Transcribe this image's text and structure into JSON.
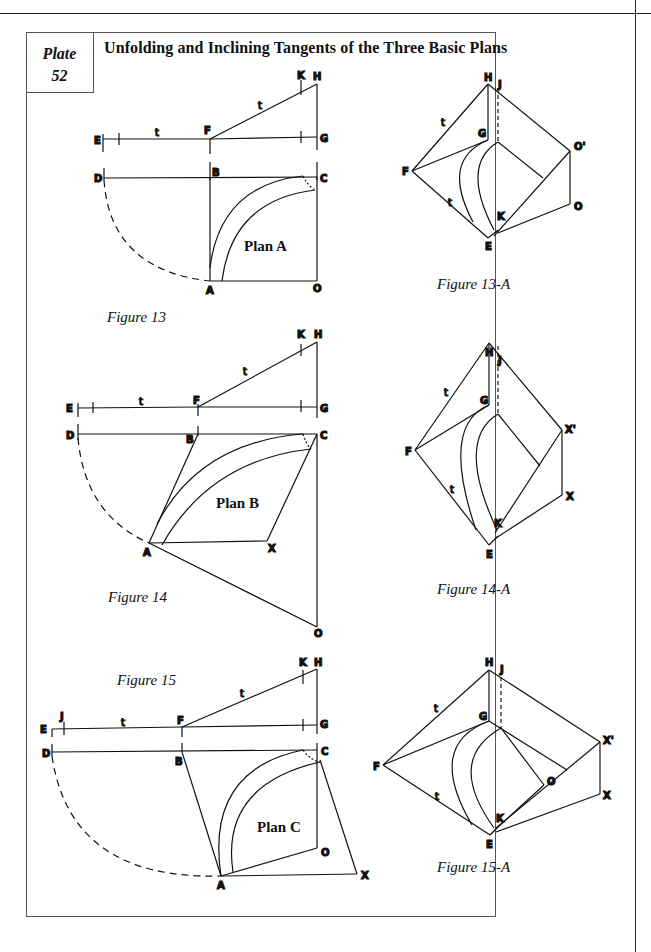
{
  "header": {
    "running_text": "...ng and ...ng"
  },
  "plate": {
    "word": "Plate",
    "number": "52"
  },
  "title": "Unfolding and Inclining Tangents of the Three Basic Plans",
  "figures": [
    {
      "id": "figure-13",
      "caption": "Figure 13",
      "plan_label": "Plan A",
      "points": {
        "E": "E",
        "F": "F",
        "G": "G",
        "H": "H",
        "K": "K",
        "D": "D",
        "B": "B",
        "C": "C",
        "A": "A",
        "O": "O",
        "t1": "t",
        "t2": "t"
      }
    },
    {
      "id": "figure-13a",
      "caption": "Figure 13-A",
      "points": {
        "H": "H",
        "J": "J",
        "G": "G",
        "F": "F",
        "E": "E",
        "K": "K",
        "O": "O",
        "Oprime": "O'",
        "t1": "t",
        "t2": "t"
      }
    },
    {
      "id": "figure-14",
      "caption": "Figure 14",
      "plan_label": "Plan B",
      "points": {
        "E": "E",
        "F": "F",
        "G": "G",
        "H": "H",
        "K": "K",
        "D": "D",
        "B": "B",
        "C": "C",
        "A": "A",
        "X": "X",
        "O": "O",
        "t1": "t",
        "t2": "t"
      }
    },
    {
      "id": "figure-14a",
      "caption": "Figure 14-A",
      "points": {
        "H": "H",
        "J": "J",
        "G": "G",
        "F": "F",
        "E": "E",
        "K": "K",
        "X": "X",
        "Xprime": "X'",
        "t1": "t",
        "t2": "t"
      }
    },
    {
      "id": "figure-15",
      "caption": "Figure 15",
      "plan_label": "Plan C",
      "points": {
        "E": "E",
        "J": "J",
        "F": "F",
        "G": "G",
        "H": "H",
        "K": "K",
        "D": "D",
        "B": "B",
        "C": "C",
        "A": "A",
        "O": "O",
        "X": "X",
        "t1": "t",
        "t2": "t"
      }
    },
    {
      "id": "figure-15a",
      "caption": "Figure 15-A",
      "points": {
        "H": "H",
        "J": "J",
        "G": "G",
        "F": "F",
        "E": "E",
        "K": "K",
        "O": "O",
        "X": "X",
        "Xprime": "X'",
        "t1": "t",
        "t2": "t"
      }
    }
  ]
}
